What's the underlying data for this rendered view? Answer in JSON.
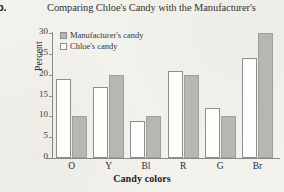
{
  "part_label": "b.",
  "chart_data": {
    "type": "bar",
    "title": "Comparing Chloe's Candy with the Manufacturer's",
    "xlabel": "Candy colors",
    "ylabel": "Percent",
    "categories": [
      "O",
      "Y",
      "Bl",
      "R",
      "G",
      "Br"
    ],
    "ylim": [
      0,
      30
    ],
    "yticks": [
      0,
      5,
      10,
      15,
      20,
      25,
      30
    ],
    "grid": false,
    "legend_position": "top-left",
    "series": [
      {
        "name": "Manufacturer's candy",
        "color": "#b7b7b2",
        "values": [
          10,
          20,
          10,
          20,
          10,
          30
        ]
      },
      {
        "name": "Chloe's candy",
        "color": "#ffffff",
        "values": [
          19,
          17,
          9,
          21,
          12,
          24
        ]
      }
    ],
    "series_draw_order": [
      "Chloe's candy",
      "Manufacturer's candy"
    ]
  }
}
